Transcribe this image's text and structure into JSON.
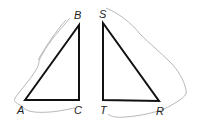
{
  "diagram": {
    "triangles": [
      {
        "name": "ABC",
        "right_angle_at": "C",
        "vertices": {
          "A": {
            "label": "A",
            "x": 25,
            "y": 100
          },
          "B": {
            "label": "B",
            "x": 79,
            "y": 25
          },
          "C": {
            "label": "C",
            "x": 79,
            "y": 100
          }
        }
      },
      {
        "name": "STR",
        "right_angle_at": "T",
        "vertices": {
          "S": {
            "label": "S",
            "x": 103,
            "y": 23
          },
          "T": {
            "label": "T",
            "x": 103,
            "y": 100
          },
          "R": {
            "label": "R",
            "x": 159,
            "y": 101
          }
        }
      }
    ],
    "labels": {
      "A": "A",
      "B": "B",
      "C": "C",
      "S": "S",
      "T": "T",
      "R": "R"
    },
    "colors": {
      "triangle_stroke": "#111111",
      "cut_outline": "#b8b8b8",
      "background": "#ffffff"
    }
  }
}
